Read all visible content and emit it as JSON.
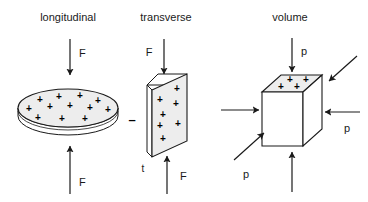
{
  "figure": {
    "title": "",
    "background_color": "#ffffff",
    "stroke_color": "#1a1a1a",
    "fill_color": "#ededed",
    "panels": [
      {
        "id": "longitudinal",
        "title": "longitudinal",
        "shape": "disc",
        "shape_description": "flat circular disc shown in perspective as an ellipse with a thin cylindrical side wall",
        "charge_signs": [
          "+",
          "+",
          "+",
          "+",
          "+",
          "+",
          "+",
          "+",
          "+",
          "+",
          "+",
          "+"
        ],
        "charge_sign_count": 12,
        "surface_polarity": "+",
        "arrows": [
          {
            "name": "top-force-arrow",
            "direction": "down",
            "label": "F"
          },
          {
            "name": "bottom-force-arrow",
            "direction": "up",
            "label": "F"
          }
        ],
        "labels": [
          {
            "name": "top-force-label",
            "text": "F"
          },
          {
            "name": "bottom-force-label",
            "text": "F"
          }
        ]
      },
      {
        "id": "transverse",
        "title": "transverse",
        "shape": "plate",
        "shape_description": "thin rectangular plate drawn in oblique perspective with thickness t",
        "charge_signs": [
          "+",
          "+",
          "+",
          "+",
          "+",
          "+",
          "+"
        ],
        "charge_sign_count": 7,
        "surface_polarity": "+",
        "opposite_polarity": "–",
        "thickness_label": "t",
        "arrows": [
          {
            "name": "top-force-arrow",
            "direction": "down",
            "label": "F"
          },
          {
            "name": "bottom-force-arrow",
            "direction": "up",
            "label": "F"
          }
        ],
        "labels": [
          {
            "name": "top-force-label",
            "text": "F"
          },
          {
            "name": "bottom-force-label",
            "text": "F"
          },
          {
            "name": "minus-label",
            "text": "–"
          },
          {
            "name": "thickness-label",
            "text": "t"
          }
        ]
      },
      {
        "id": "volume",
        "title": "volume",
        "shape": "cube",
        "shape_description": "cube drawn in isometric perspective with shaded top face, compressed from all sides by hydrostatic pressure",
        "charge_signs": [
          "+",
          "+",
          "+",
          "+"
        ],
        "charge_sign_count": 4,
        "surface_polarity": "+",
        "arrows": [
          {
            "name": "top-pressure-arrow",
            "direction": "down",
            "label": "p"
          },
          {
            "name": "bottom-pressure-arrow",
            "direction": "up",
            "label": ""
          },
          {
            "name": "left-pressure-arrow",
            "direction": "right",
            "label": ""
          },
          {
            "name": "right-pressure-arrow",
            "direction": "left",
            "label": "p"
          },
          {
            "name": "back-right-pressure-arrow",
            "direction": "down-left",
            "label": ""
          },
          {
            "name": "front-left-pressure-arrow",
            "direction": "up-right",
            "label": "p"
          }
        ],
        "labels": [
          {
            "name": "top-pressure-label",
            "text": "p"
          },
          {
            "name": "right-pressure-label",
            "text": "p"
          },
          {
            "name": "front-pressure-label",
            "text": "p"
          }
        ]
      }
    ]
  }
}
